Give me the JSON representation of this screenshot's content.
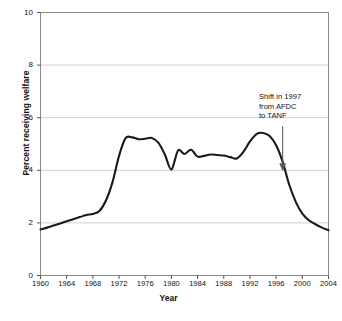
{
  "chart_data": {
    "type": "line",
    "title": "",
    "xlabel": "Year",
    "ylabel": "Percent receiving welfare",
    "xlim": [
      1960,
      2004
    ],
    "ylim": [
      0,
      10
    ],
    "grid": true,
    "legend": null,
    "x_ticks": [
      "1960",
      "1964",
      "1968",
      "1972",
      "1976",
      "1980",
      "1984",
      "1988",
      "1992",
      "1996",
      "2000",
      "2004"
    ],
    "y_ticks": [
      "0",
      "2",
      "4",
      "6",
      "8",
      "10"
    ],
    "annotations": [
      {
        "name": "shift-annotation",
        "text_lines": [
          "Shift in 1997",
          "from AFDC",
          "to TANF"
        ],
        "points_to_year": 1997,
        "points_to_value": 4.0
      }
    ],
    "series": [
      {
        "name": "Percent receiving welfare",
        "color": "#1a1a1a",
        "x": [
          1960,
          1961,
          1962,
          1963,
          1964,
          1965,
          1966,
          1967,
          1968,
          1969,
          1970,
          1971,
          1972,
          1973,
          1974,
          1975,
          1976,
          1977,
          1978,
          1979,
          1980,
          1981,
          1982,
          1983,
          1984,
          1985,
          1986,
          1987,
          1988,
          1989,
          1990,
          1991,
          1992,
          1993,
          1994,
          1995,
          1996,
          1997,
          1998,
          1999,
          2000,
          2001,
          2002,
          2003,
          2004
        ],
        "values": [
          1.75,
          1.82,
          1.9,
          1.98,
          2.06,
          2.14,
          2.22,
          2.3,
          2.34,
          2.45,
          2.85,
          3.55,
          4.55,
          5.22,
          5.25,
          5.18,
          5.2,
          5.23,
          5.05,
          4.6,
          4.03,
          4.75,
          4.62,
          4.78,
          4.52,
          4.55,
          4.6,
          4.58,
          4.56,
          4.5,
          4.45,
          4.7,
          5.1,
          5.38,
          5.42,
          5.3,
          4.95,
          4.32,
          3.45,
          2.8,
          2.35,
          2.1,
          1.95,
          1.82,
          1.72
        ]
      }
    ]
  },
  "axis": {
    "y_title": "Percent receiving welfare",
    "x_title": "Year"
  }
}
